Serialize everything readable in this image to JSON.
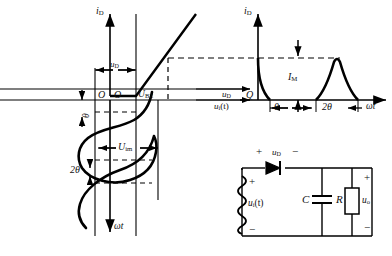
{
  "figure": {
    "stroke_color": "#000000",
    "dashed_color": "#000000",
    "background": "#ffffff"
  },
  "transfer_plot": {
    "name": "diode-transfer-characteristic",
    "y_axis_label": "i",
    "y_axis_sub": "D",
    "origin_label_left": "O",
    "origin_label_right": "O",
    "threshold_label": "U",
    "threshold_sub": "BZ",
    "bias_label": "u",
    "bias_sub": "D"
  },
  "input_waveform": {
    "name": "input-sinusoid-vertical",
    "time_axis_label": "ωt",
    "amplitude_label": "U",
    "amplitude_sub": "im",
    "angle_label": "θ",
    "double_angle_label": "2θ"
  },
  "current_pulses": {
    "name": "diode-current-pulse-train",
    "y_axis_label": "i",
    "y_axis_sub": "D",
    "origin_label": "Q",
    "peak_label": "I",
    "peak_sub": "M",
    "angle_label": "θ",
    "double_angle_label": "2θ",
    "time_axis_label": "ωt",
    "voltage_axis_label": "u",
    "voltage_axis_sub": "D",
    "source_axis_label": "u",
    "source_axis_sub": "i",
    "source_axis_suffix": "(t)"
  },
  "circuit": {
    "name": "half-wave-rectifier-circuit",
    "source_label": "u",
    "source_sub": "i",
    "source_suffix": "(t)",
    "source_plus": "+",
    "source_minus": "−",
    "diode_label": "u",
    "diode_sub": "D",
    "diode_plus": "+",
    "diode_minus": "−",
    "capacitor_label": "C",
    "resistor_label": "R",
    "output_label": "u",
    "output_sub": "o",
    "output_plus": "+",
    "output_minus": "−"
  }
}
